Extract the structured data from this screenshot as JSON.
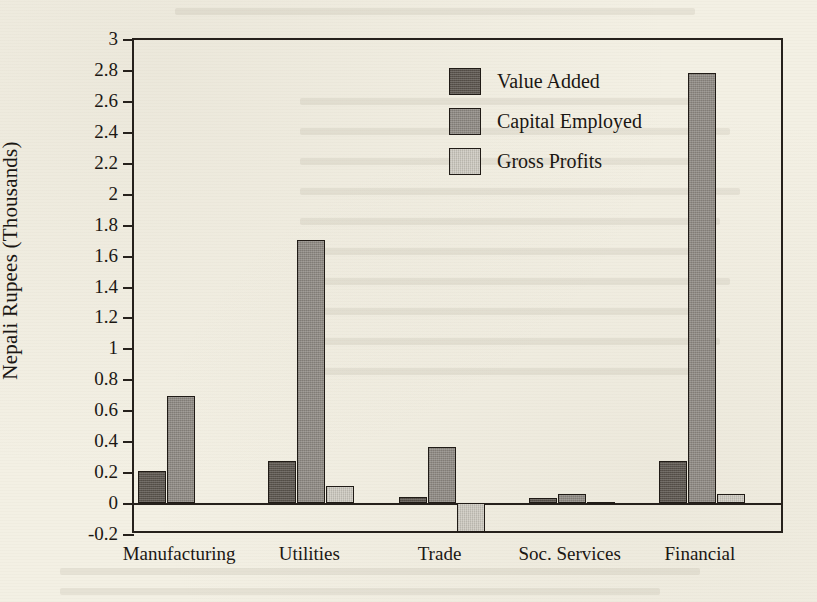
{
  "chart_data": {
    "type": "bar",
    "title": "",
    "xlabel": "",
    "ylabel": "Nepali Rupees (Thousands)",
    "categories": [
      "Manufacturing",
      "Utilities",
      "Trade",
      "Soc. Services",
      "Financial"
    ],
    "series": [
      {
        "name": "Value Added",
        "color": "#5b554e",
        "values": [
          0.21,
          0.27,
          0.04,
          0.03,
          0.27
        ]
      },
      {
        "name": "Capital Employed",
        "color": "#8f8a83",
        "values": [
          0.69,
          1.7,
          0.36,
          0.06,
          2.78
        ]
      },
      {
        "name": "Gross Profits",
        "color": "#cdc9c0",
        "values": [
          0.0,
          0.11,
          -0.19,
          0.005,
          0.06
        ]
      }
    ],
    "ylim": [
      -0.2,
      3
    ],
    "ytick_labels": [
      "3",
      "2.8",
      "2.6",
      "2.4",
      "2.2",
      "2",
      "1.8",
      "1.6",
      "1.4",
      "1.2",
      "1",
      "0.8",
      "0.6",
      "0.4",
      "0.2",
      "0",
      "-0.2"
    ],
    "ytick_values": [
      3,
      2.8,
      2.6,
      2.4,
      2.2,
      2,
      1.8,
      1.6,
      1.4,
      1.2,
      1,
      0.8,
      0.6,
      0.4,
      0.2,
      0,
      -0.2
    ],
    "grid": false,
    "legend_position": "top-center-right",
    "legend_entries": [
      "Value Added",
      "Capital Employed",
      "Gross Profits"
    ]
  }
}
